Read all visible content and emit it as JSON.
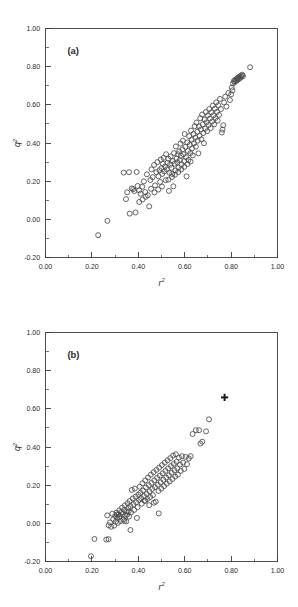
{
  "figure": {
    "background_color": "#ffffff",
    "marker_color": "#4a4a4a",
    "axis_color": "#3a3a3a",
    "highlight_color": "#1a1a1a"
  },
  "chart_data": [
    {
      "type": "scatter",
      "panel": "(a)",
      "title": "",
      "xlabel": "r²",
      "ylabel": "q²",
      "xlabel_base": "r",
      "xlabel_sup": "2",
      "ylabel_base": "q",
      "ylabel_sup": "2",
      "xlim": [
        0.0,
        1.0
      ],
      "ylim": [
        -0.2,
        1.0
      ],
      "xticks": [
        0.0,
        0.2,
        0.4,
        0.6,
        0.8,
        1.0
      ],
      "xtick_labels": [
        "0.00",
        "0.20",
        "0.40",
        "0.60",
        "0.80",
        "1.00"
      ],
      "yticks": [
        -0.2,
        0.0,
        0.2,
        0.4,
        0.6,
        0.8,
        1.0
      ],
      "ytick_labels": [
        "-0.20",
        "0.00",
        "0.20",
        "0.40",
        "0.60",
        "0.80",
        "1.00"
      ],
      "minor_tick_step_x": 0.1,
      "minor_tick_step_y": 0.1,
      "grid": false,
      "legend": false,
      "marker": "open-circle",
      "points": [
        [
          0.227,
          -0.083
        ],
        [
          0.267,
          -0.008
        ],
        [
          0.337,
          0.245
        ],
        [
          0.347,
          0.106
        ],
        [
          0.352,
          0.142
        ],
        [
          0.36,
          0.247
        ],
        [
          0.363,
          0.03
        ],
        [
          0.372,
          0.162
        ],
        [
          0.378,
          0.158
        ],
        [
          0.383,
          0.148
        ],
        [
          0.388,
          0.036
        ],
        [
          0.393,
          0.248
        ],
        [
          0.397,
          0.175
        ],
        [
          0.404,
          0.152
        ],
        [
          0.41,
          0.134
        ],
        [
          0.417,
          0.171
        ],
        [
          0.424,
          0.199
        ],
        [
          0.43,
          0.143
        ],
        [
          0.437,
          0.236
        ],
        [
          0.441,
          0.126
        ],
        [
          0.447,
          0.068
        ],
        [
          0.452,
          0.206
        ],
        [
          0.457,
          0.262
        ],
        [
          0.462,
          0.221
        ],
        [
          0.468,
          0.285
        ],
        [
          0.472,
          0.178
        ],
        [
          0.478,
          0.247
        ],
        [
          0.482,
          0.3
        ],
        [
          0.487,
          0.226
        ],
        [
          0.491,
          0.257
        ],
        [
          0.494,
          0.196
        ],
        [
          0.497,
          0.313
        ],
        [
          0.5,
          0.268
        ],
        [
          0.503,
          0.238
        ],
        [
          0.506,
          0.291
        ],
        [
          0.509,
          0.322
        ],
        [
          0.512,
          0.251
        ],
        [
          0.515,
          0.277
        ],
        [
          0.518,
          0.205
        ],
        [
          0.52,
          0.341
        ],
        [
          0.523,
          0.262
        ],
        [
          0.526,
          0.296
        ],
        [
          0.529,
          0.318
        ],
        [
          0.532,
          0.149
        ],
        [
          0.534,
          0.244
        ],
        [
          0.537,
          0.286
        ],
        [
          0.54,
          0.33
        ],
        [
          0.543,
          0.27
        ],
        [
          0.546,
          0.238
        ],
        [
          0.549,
          0.305
        ],
        [
          0.551,
          0.173
        ],
        [
          0.554,
          0.347
        ],
        [
          0.557,
          0.292
        ],
        [
          0.56,
          0.256
        ],
        [
          0.562,
          0.382
        ],
        [
          0.565,
          0.318
        ],
        [
          0.568,
          0.299
        ],
        [
          0.571,
          0.341
        ],
        [
          0.573,
          0.27
        ],
        [
          0.576,
          0.356
        ],
        [
          0.579,
          0.31
        ],
        [
          0.582,
          0.397
        ],
        [
          0.584,
          0.333
        ],
        [
          0.587,
          0.288
        ],
        [
          0.59,
          0.366
        ],
        [
          0.592,
          0.412
        ],
        [
          0.595,
          0.341
        ],
        [
          0.598,
          0.305
        ],
        [
          0.6,
          0.447
        ],
        [
          0.603,
          0.38
        ],
        [
          0.606,
          0.326
        ],
        [
          0.608,
          0.225
        ],
        [
          0.611,
          0.403
        ],
        [
          0.614,
          0.358
        ],
        [
          0.616,
          0.311
        ],
        [
          0.619,
          0.436
        ],
        [
          0.622,
          0.39
        ],
        [
          0.624,
          0.347
        ],
        [
          0.627,
          0.465
        ],
        [
          0.63,
          0.418
        ],
        [
          0.632,
          0.372
        ],
        [
          0.635,
          0.335
        ],
        [
          0.638,
          0.447
        ],
        [
          0.64,
          0.398
        ],
        [
          0.643,
          0.488
        ],
        [
          0.646,
          0.428
        ],
        [
          0.648,
          0.381
        ],
        [
          0.651,
          0.507
        ],
        [
          0.654,
          0.459
        ],
        [
          0.656,
          0.412
        ],
        [
          0.659,
          0.346
        ],
        [
          0.662,
          0.487
        ],
        [
          0.664,
          0.438
        ],
        [
          0.667,
          0.53
        ],
        [
          0.67,
          0.471
        ],
        [
          0.672,
          0.419
        ],
        [
          0.675,
          0.549
        ],
        [
          0.678,
          0.498
        ],
        [
          0.68,
          0.452
        ],
        [
          0.683,
          0.399
        ],
        [
          0.686,
          0.523
        ],
        [
          0.688,
          0.475
        ],
        [
          0.691,
          0.562
        ],
        [
          0.694,
          0.508
        ],
        [
          0.697,
          0.462
        ],
        [
          0.7,
          0.545
        ],
        [
          0.703,
          0.494
        ],
        [
          0.706,
          0.578
        ],
        [
          0.709,
          0.528
        ],
        [
          0.712,
          0.478
        ],
        [
          0.715,
          0.561
        ],
        [
          0.718,
          0.512
        ],
        [
          0.721,
          0.596
        ],
        [
          0.724,
          0.545
        ],
        [
          0.727,
          0.498
        ],
        [
          0.73,
          0.58
        ],
        [
          0.733,
          0.531
        ],
        [
          0.736,
          0.613
        ],
        [
          0.739,
          0.563
        ],
        [
          0.742,
          0.517
        ],
        [
          0.745,
          0.598
        ],
        [
          0.748,
          0.547
        ],
        [
          0.752,
          0.631
        ],
        [
          0.756,
          0.578
        ],
        [
          0.76,
          0.455
        ],
        [
          0.763,
          0.47
        ],
        [
          0.766,
          0.493
        ],
        [
          0.77,
          0.612
        ],
        [
          0.775,
          0.643
        ],
        [
          0.78,
          0.591
        ],
        [
          0.788,
          0.662
        ],
        [
          0.795,
          0.625
        ],
        [
          0.803,
          0.69
        ],
        [
          0.808,
          0.712
        ],
        [
          0.812,
          0.725
        ],
        [
          0.815,
          0.718
        ],
        [
          0.818,
          0.731
        ],
        [
          0.821,
          0.724
        ],
        [
          0.824,
          0.737
        ],
        [
          0.827,
          0.73
        ],
        [
          0.83,
          0.742
        ],
        [
          0.833,
          0.735
        ],
        [
          0.836,
          0.748
        ],
        [
          0.839,
          0.741
        ],
        [
          0.842,
          0.753
        ],
        [
          0.845,
          0.746
        ],
        [
          0.848,
          0.758
        ],
        [
          0.851,
          0.751
        ],
        [
          0.806,
          0.676
        ],
        [
          0.8,
          0.655
        ],
        [
          0.882,
          0.797
        ],
        [
          0.53,
          0.208
        ],
        [
          0.545,
          0.222
        ],
        [
          0.558,
          0.234
        ],
        [
          0.572,
          0.248
        ],
        [
          0.585,
          0.262
        ],
        [
          0.598,
          0.275
        ],
        [
          0.612,
          0.29
        ],
        [
          0.625,
          0.303
        ],
        [
          0.455,
          0.16
        ],
        [
          0.47,
          0.141
        ],
        [
          0.486,
          0.156
        ],
        [
          0.502,
          0.172
        ],
        [
          0.432,
          0.118
        ],
        [
          0.418,
          0.104
        ],
        [
          0.404,
          0.091
        ]
      ]
    },
    {
      "type": "scatter",
      "panel": "(b)",
      "title": "",
      "xlabel": "r²",
      "ylabel": "q²",
      "xlabel_base": "r",
      "xlabel_sup": "2",
      "ylabel_base": "q",
      "ylabel_sup": "2",
      "xlim": [
        0.0,
        1.0
      ],
      "ylim": [
        -0.2,
        1.0
      ],
      "xticks": [
        0.0,
        0.2,
        0.4,
        0.6,
        0.8,
        1.0
      ],
      "xtick_labels": [
        "0.00",
        "0.20",
        "0.40",
        "0.60",
        "0.80",
        "1.00"
      ],
      "yticks": [
        -0.2,
        0.0,
        0.2,
        0.4,
        0.6,
        0.8,
        1.0
      ],
      "ytick_labels": [
        "-0.20",
        "0.00",
        "0.20",
        "0.40",
        "0.60",
        "0.80",
        "1.00"
      ],
      "minor_tick_step_x": 0.1,
      "minor_tick_step_y": 0.1,
      "grid": false,
      "legend": false,
      "marker": "open-circle",
      "highlight_marker": {
        "marker": "filled-cross",
        "x": 0.772,
        "y": 0.66
      },
      "points": [
        [
          0.196,
          -0.172
        ],
        [
          0.211,
          -0.082
        ],
        [
          0.262,
          -0.085
        ],
        [
          0.272,
          -0.083
        ],
        [
          0.266,
          0.042
        ],
        [
          0.272,
          -0.01
        ],
        [
          0.278,
          0.005
        ],
        [
          0.283,
          -0.018
        ],
        [
          0.288,
          0.05
        ],
        [
          0.292,
          0.022
        ],
        [
          0.296,
          -0.012
        ],
        [
          0.3,
          0.038
        ],
        [
          0.303,
          0.008
        ],
        [
          0.306,
          0.056
        ],
        [
          0.309,
          0.03
        ],
        [
          0.312,
          0.002
        ],
        [
          0.315,
          0.046
        ],
        [
          0.318,
          0.068
        ],
        [
          0.321,
          0.038
        ],
        [
          0.324,
          0.012
        ],
        [
          0.327,
          0.058
        ],
        [
          0.33,
          0.082
        ],
        [
          0.333,
          0.048
        ],
        [
          0.336,
          0.02
        ],
        [
          0.339,
          0.07
        ],
        [
          0.342,
          0.094
        ],
        [
          0.345,
          0.04
        ],
        [
          0.348,
          0.01
        ],
        [
          0.351,
          0.062
        ],
        [
          0.354,
          0.105
        ],
        [
          0.357,
          0.08
        ],
        [
          0.36,
          0.035
        ],
        [
          0.363,
          0.117
        ],
        [
          0.366,
          0.09
        ],
        [
          0.369,
          0.058
        ],
        [
          0.372,
          0.175
        ],
        [
          0.376,
          0.13
        ],
        [
          0.379,
          0.1
        ],
        [
          0.382,
          0.07
        ],
        [
          0.385,
          0.182
        ],
        [
          0.388,
          0.14
        ],
        [
          0.391,
          0.11
        ],
        [
          0.394,
          0.028
        ],
        [
          0.397,
          0.085
        ],
        [
          0.4,
          0.15
        ],
        [
          0.403,
          0.122
        ],
        [
          0.406,
          0.192
        ],
        [
          0.409,
          0.16
        ],
        [
          0.412,
          0.132
        ],
        [
          0.415,
          0.103
        ],
        [
          0.418,
          0.21
        ],
        [
          0.421,
          0.172
        ],
        [
          0.424,
          0.143
        ],
        [
          0.427,
          0.118
        ],
        [
          0.43,
          0.225
        ],
        [
          0.433,
          0.188
        ],
        [
          0.436,
          0.155
        ],
        [
          0.439,
          0.128
        ],
        [
          0.442,
          0.24
        ],
        [
          0.445,
          0.2
        ],
        [
          0.448,
          0.168
        ],
        [
          0.451,
          0.138
        ],
        [
          0.454,
          0.255
        ],
        [
          0.457,
          0.212
        ],
        [
          0.46,
          0.18
        ],
        [
          0.463,
          0.148
        ],
        [
          0.466,
          0.268
        ],
        [
          0.469,
          0.225
        ],
        [
          0.472,
          0.19
        ],
        [
          0.475,
          0.113
        ],
        [
          0.478,
          0.28
        ],
        [
          0.481,
          0.238
        ],
        [
          0.484,
          0.202
        ],
        [
          0.487,
          0.17
        ],
        [
          0.49,
          0.292
        ],
        [
          0.493,
          0.25
        ],
        [
          0.496,
          0.215
        ],
        [
          0.499,
          0.182
        ],
        [
          0.502,
          0.305
        ],
        [
          0.505,
          0.262
        ],
        [
          0.508,
          0.228
        ],
        [
          0.511,
          0.195
        ],
        [
          0.514,
          0.318
        ],
        [
          0.517,
          0.275
        ],
        [
          0.52,
          0.24
        ],
        [
          0.523,
          0.208
        ],
        [
          0.526,
          0.33
        ],
        [
          0.529,
          0.288
        ],
        [
          0.532,
          0.252
        ],
        [
          0.535,
          0.22
        ],
        [
          0.538,
          0.342
        ],
        [
          0.541,
          0.3
        ],
        [
          0.544,
          0.265
        ],
        [
          0.547,
          0.232
        ],
        [
          0.55,
          0.355
        ],
        [
          0.553,
          0.312
        ],
        [
          0.556,
          0.278
        ],
        [
          0.559,
          0.245
        ],
        [
          0.562,
          0.362
        ],
        [
          0.565,
          0.322
        ],
        [
          0.568,
          0.288
        ],
        [
          0.571,
          0.255
        ],
        [
          0.575,
          0.345
        ],
        [
          0.579,
          0.308
        ],
        [
          0.583,
          0.275
        ],
        [
          0.588,
          0.352
        ],
        [
          0.593,
          0.318
        ],
        [
          0.598,
          0.285
        ],
        [
          0.604,
          0.348
        ],
        [
          0.61,
          0.31
        ],
        [
          0.618,
          0.34
        ],
        [
          0.626,
          0.352
        ],
        [
          0.634,
          0.468
        ],
        [
          0.648,
          0.488
        ],
        [
          0.662,
          0.488
        ],
        [
          0.668,
          0.418
        ],
        [
          0.676,
          0.428
        ],
        [
          0.692,
          0.482
        ],
        [
          0.705,
          0.545
        ],
        [
          0.488,
          0.052
        ],
        [
          0.467,
          0.108
        ],
        [
          0.447,
          0.095
        ],
        [
          0.43,
          0.118
        ],
        [
          0.366,
          -0.035
        ],
        [
          0.34,
          0.012
        ],
        [
          0.352,
          0.046
        ],
        [
          0.358,
          0.062
        ],
        [
          0.308,
          0.046
        ],
        [
          0.318,
          0.032
        ]
      ]
    }
  ]
}
